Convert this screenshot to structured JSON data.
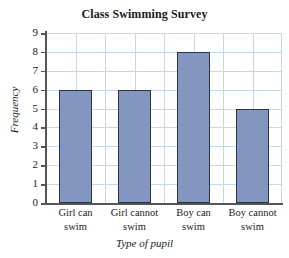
{
  "chart_data": {
    "type": "bar",
    "title": "Class Swimming Survey",
    "xlabel": "Type of pupil",
    "ylabel": "Frequency",
    "categories": [
      "Girl can swim",
      "Girl cannot swim",
      "Boy can swim",
      "Boy cannot swim"
    ],
    "category_lines": [
      [
        "Girl can",
        "swim"
      ],
      [
        "Girl cannot",
        "swim"
      ],
      [
        "Boy can",
        "swim"
      ],
      [
        "Boy cannot",
        "swim"
      ]
    ],
    "values": [
      6,
      6,
      8,
      5
    ],
    "ylim": [
      0,
      9
    ],
    "ytick_labels": [
      "0",
      "1",
      "2",
      "3",
      "4",
      "5",
      "6",
      "7",
      "8",
      "9"
    ],
    "ytick_values": [
      0,
      1,
      2,
      3,
      4,
      5,
      6,
      7,
      8,
      9
    ],
    "grid": true,
    "legend": "none",
    "colors": {
      "bar_fill": "#8296c0",
      "bar_border": "#2c3346",
      "gridline": "#c2d9ea",
      "axis": "#555555",
      "text": "#1a1a1a",
      "background": "#ffffff"
    }
  }
}
